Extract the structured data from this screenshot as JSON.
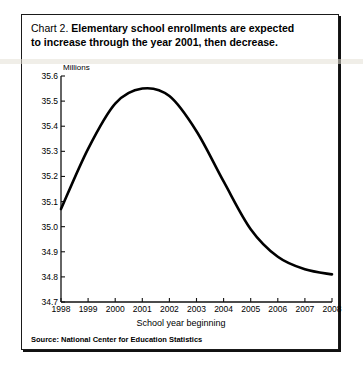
{
  "figure": {
    "title_prefix": "Chart 2.",
    "title_line1": "Elementary school enrollments are expected",
    "title_line2": "to increase through the year 2001, then decrease.",
    "source": "Source: National Center for Education Statistics",
    "frame_color": "#1a1a1a",
    "line_color": "#000000",
    "background": "#ffffff"
  },
  "chart_data": {
    "type": "line",
    "title": "Chart 2. Elementary school enrollments are expected to increase through the year 2001, then decrease.",
    "xlabel": "School year beginning",
    "ylabel": "Millions",
    "unit_label": "Millions",
    "grid": false,
    "legend": "none",
    "xlim": [
      1998,
      2008
    ],
    "ylim": [
      34.7,
      35.6
    ],
    "xticks": [
      1998,
      1999,
      2000,
      2001,
      2002,
      2003,
      2004,
      2005,
      2006,
      2007,
      2008
    ],
    "xtick_labels": [
      "1998",
      "1999",
      "2000",
      "2001",
      "2002",
      "2003",
      "2004",
      "2005",
      "2006",
      "2007",
      "2008"
    ],
    "yticks": [
      34.7,
      34.8,
      34.9,
      35.0,
      35.1,
      35.2,
      35.3,
      35.4,
      35.5,
      35.6
    ],
    "ytick_labels": [
      "34.7",
      "34.8",
      "34.9",
      "35.0",
      "35.1",
      "35.2",
      "35.3",
      "35.4",
      "35.5",
      "35.6"
    ],
    "series": [
      {
        "name": "Elementary school enrollment",
        "x": [
          1998,
          1999,
          2000,
          2001,
          2002,
          2003,
          2004,
          2005,
          2006,
          2007,
          2008
        ],
        "values": [
          35.07,
          35.31,
          35.49,
          35.55,
          35.52,
          35.38,
          35.18,
          34.99,
          34.88,
          34.83,
          34.81
        ]
      }
    ],
    "annotations": [
      "Peak occurs at school year beginning 2001 at about 35.55 million.",
      "Values decline steadily after 2001, flattening near 34.81 million by 2008."
    ]
  }
}
